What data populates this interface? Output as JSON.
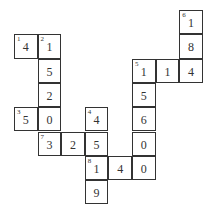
{
  "puzzle": {
    "type": "number-crossword",
    "origin": {
      "x": 14,
      "y": 10
    },
    "cell_size": {
      "w": 23.6,
      "h": 24.3
    },
    "cells": [
      {
        "row": 0,
        "col": 7,
        "value": "1",
        "clue": "6"
      },
      {
        "row": 1,
        "col": 0,
        "value": "4",
        "clue": "1"
      },
      {
        "row": 1,
        "col": 1,
        "value": "1",
        "clue": "2"
      },
      {
        "row": 1,
        "col": 7,
        "value": "8",
        "clue": ""
      },
      {
        "row": 2,
        "col": 1,
        "value": "5",
        "clue": ""
      },
      {
        "row": 2,
        "col": 5,
        "value": "1",
        "clue": "5"
      },
      {
        "row": 2,
        "col": 6,
        "value": "1",
        "clue": ""
      },
      {
        "row": 2,
        "col": 7,
        "value": "4",
        "clue": ""
      },
      {
        "row": 3,
        "col": 1,
        "value": "2",
        "clue": ""
      },
      {
        "row": 3,
        "col": 5,
        "value": "5",
        "clue": ""
      },
      {
        "row": 4,
        "col": 0,
        "value": "5",
        "clue": "3"
      },
      {
        "row": 4,
        "col": 1,
        "value": "0",
        "clue": ""
      },
      {
        "row": 4,
        "col": 3,
        "value": "4",
        "clue": "4"
      },
      {
        "row": 4,
        "col": 5,
        "value": "6",
        "clue": ""
      },
      {
        "row": 5,
        "col": 1,
        "value": "3",
        "clue": "7"
      },
      {
        "row": 5,
        "col": 2,
        "value": "2",
        "clue": ""
      },
      {
        "row": 5,
        "col": 3,
        "value": "5",
        "clue": ""
      },
      {
        "row": 5,
        "col": 5,
        "value": "0",
        "clue": ""
      },
      {
        "row": 6,
        "col": 3,
        "value": "1",
        "clue": "8"
      },
      {
        "row": 6,
        "col": 4,
        "value": "4",
        "clue": ""
      },
      {
        "row": 6,
        "col": 5,
        "value": "0",
        "clue": ""
      },
      {
        "row": 7,
        "col": 3,
        "value": "9",
        "clue": ""
      }
    ]
  }
}
